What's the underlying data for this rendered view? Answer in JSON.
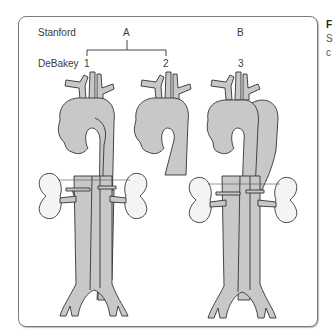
{
  "diagram": {
    "row_labels": {
      "stanford": "Stanford",
      "debakey": "DeBakey"
    },
    "stanford_types": [
      {
        "label": "A",
        "covers_debakey": [
          "1",
          "2"
        ]
      },
      {
        "label": "B",
        "covers_debakey": [
          "3"
        ]
      }
    ],
    "debakey_types": [
      {
        "label": "1",
        "extent": "ascending aorta through abdominal aorta"
      },
      {
        "label": "2",
        "extent": "ascending aorta only"
      },
      {
        "label": "3",
        "extent": "descending aorta distal to left subclavian"
      }
    ],
    "colors": {
      "vessel_fill": "#c8c8c8",
      "outline": "#333333",
      "kidney_fill": "#f4f4f4",
      "frame": "#7a7a7a"
    }
  },
  "side_text": {
    "line1": "F",
    "line2": "S",
    "line3": "c"
  }
}
